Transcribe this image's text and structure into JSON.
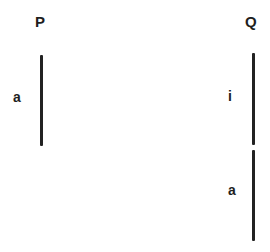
{
  "diagram": {
    "columns": [
      {
        "title": "P",
        "segments": [
          {
            "label": "a"
          }
        ]
      },
      {
        "title": "Q",
        "segments": [
          {
            "label": "i"
          },
          {
            "label": "a"
          }
        ]
      }
    ],
    "colors": {
      "line": "#222222",
      "text": "#1e1e1e",
      "background": "#ffffff"
    }
  }
}
